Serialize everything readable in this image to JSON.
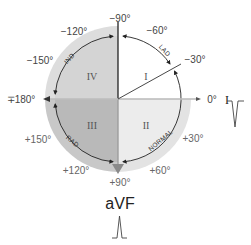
{
  "diagram": {
    "type": "hexaxial-axis-quadrant-diagram",
    "center": {
      "x": 118,
      "y": 99
    },
    "outer_radius": 73,
    "inner_radius": 63,
    "colors": {
      "quadrant_I": "#ffffff",
      "quadrant_II": "#ebebeb",
      "quadrant_III": "#bdbdbd",
      "quadrant_IV": "#d6d6d6",
      "ring": "#dcdcdc",
      "ring_dark": "#c4c4c4",
      "axis": "#333333",
      "axis_light": "#999999",
      "arrow_fill": "#888888"
    },
    "quadrants": [
      {
        "id": "I",
        "label": "I"
      },
      {
        "id": "II",
        "label": "II"
      },
      {
        "id": "III",
        "label": "III"
      },
      {
        "id": "IV",
        "label": "IV"
      }
    ],
    "arc_labels": {
      "lad": "LAD",
      "normal": "NORMAL",
      "rad": "RAD",
      "ind": "IND"
    },
    "angle_labels": {
      "minus90": "−90°",
      "minus60": "−60°",
      "minus30": "−30°",
      "zero": "0°",
      "plus30": "+30°",
      "plus60": "+60°",
      "plus90": "+90°",
      "plus120": "+120°",
      "plus150": "+150°",
      "pm180": "∓180°",
      "minus150": "−150°",
      "minus120": "−120°"
    },
    "leads": {
      "lead_I": "I",
      "lead_aVF": "aVF"
    },
    "waveforms": {
      "lead_I": "negative-deflection",
      "lead_aVF": "positive-deflection"
    }
  }
}
